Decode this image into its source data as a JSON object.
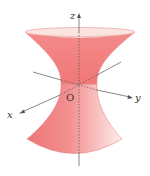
{
  "figure": {
    "type": "hyperboloid-of-one-sheet",
    "labels": {
      "z_axis": "z",
      "y_axis": "y",
      "x_axis": "x",
      "origin": "O"
    },
    "colors": {
      "surface_dark": "#f07a7a",
      "surface_light": "#fde8e4",
      "surface_top": "#f5a0a0",
      "rim_light": "#fbe0dc",
      "edge": "#d97070",
      "axis": "#555555"
    }
  }
}
